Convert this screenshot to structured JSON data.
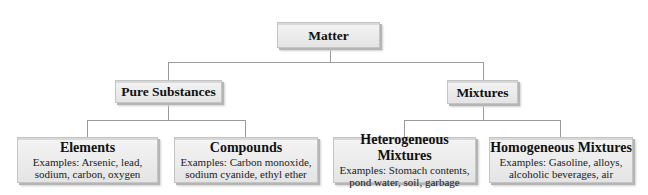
{
  "diagram": {
    "root": {
      "title": "Matter"
    },
    "level1": [
      {
        "title": "Pure Substances"
      },
      {
        "title": "Mixtures"
      }
    ],
    "level2": [
      {
        "title": "Elements",
        "parent": "Pure Substances",
        "desc_line1": "Examples: Arsenic, lead,",
        "desc_line2": "sodium, carbon, oxygen"
      },
      {
        "title": "Compounds",
        "parent": "Pure Substances",
        "desc_line1": "Examples: Carbon monoxide,",
        "desc_line2": "sodium cyanide, ethyl ether"
      },
      {
        "title": "Heterogeneous Mixtures",
        "parent": "Mixtures",
        "desc_line1": "Examples: Stomach contents,",
        "desc_line2": "pond water, soil, garbage"
      },
      {
        "title": "Homogeneous Mixtures",
        "parent": "Mixtures",
        "desc_line1": "Examples: Gasoline, alloys,",
        "desc_line2": "alcoholic beverages, air"
      }
    ],
    "colors": {
      "connector": "#9a9a9a",
      "box_fill": "#ececec",
      "box_border": "#c4c4c4",
      "text": "#111111"
    }
  }
}
